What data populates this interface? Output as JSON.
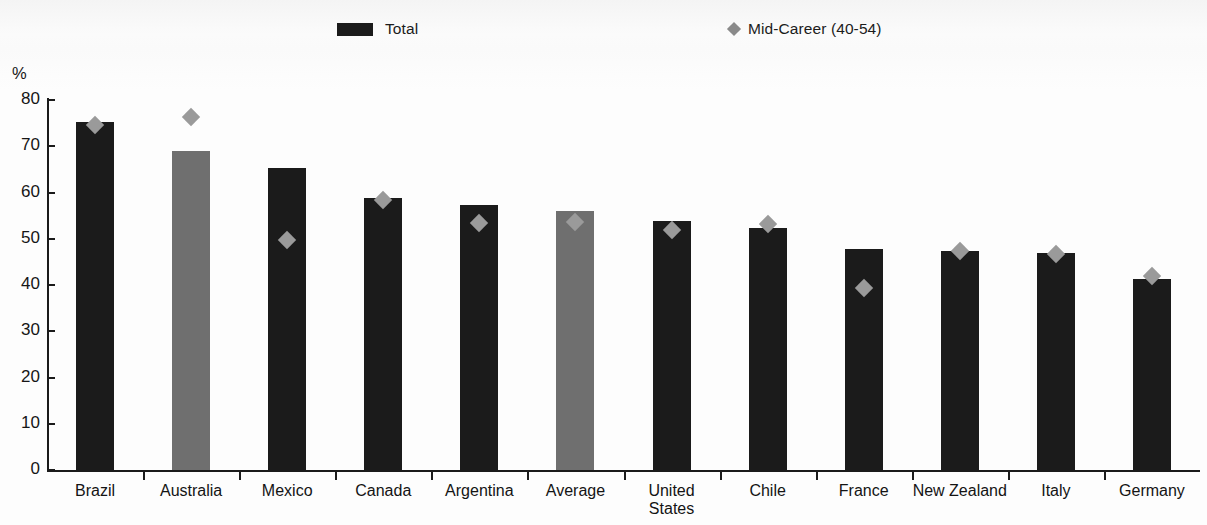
{
  "legend": {
    "items": [
      {
        "label": "Total",
        "marker": "square-swatch",
        "color": "#1b1b1b"
      },
      {
        "label": "Mid-Career (40-54)",
        "marker": "diamond-marker",
        "color": "#8a8a8a"
      }
    ]
  },
  "axis": {
    "y_unit": "%",
    "y_ticks": [
      "80",
      "70",
      "60",
      "50",
      "40",
      "30",
      "20",
      "10",
      "0"
    ],
    "y_min": 0,
    "y_max": 80,
    "y_step": 10
  },
  "colors": {
    "bar_default": "#1b1b1b",
    "bar_highlight": "#6f6f6f",
    "marker": "#9a9a9a",
    "axis": "#1b1b1b",
    "background": "#fdfdfd"
  },
  "chart_data": {
    "type": "bar",
    "title": "",
    "subtitle": "",
    "xlabel": "",
    "ylabel": "%",
    "ylim": [
      0,
      80
    ],
    "grid": false,
    "legend_position": "top",
    "categories": [
      "Brazil",
      "Australia",
      "Mexico",
      "Canada",
      "Argentina",
      "Average",
      "United\nStates",
      "Chile",
      "France",
      "New Zealand",
      "Italy",
      "Germany"
    ],
    "highlighted_categories": [
      "Australia",
      "Average"
    ],
    "series": [
      {
        "name": "Total",
        "type": "bar",
        "values": [
          75.3,
          69.0,
          65.4,
          58.9,
          57.3,
          55.9,
          53.9,
          52.4,
          47.8,
          47.4,
          47.0,
          41.3
        ]
      },
      {
        "name": "Mid-Career (40-54)",
        "type": "scatter",
        "values": [
          74.6,
          76.3,
          49.8,
          58.3,
          53.5,
          53.6,
          51.9,
          53.2,
          39.3,
          47.3,
          46.8,
          42.0
        ]
      }
    ]
  }
}
